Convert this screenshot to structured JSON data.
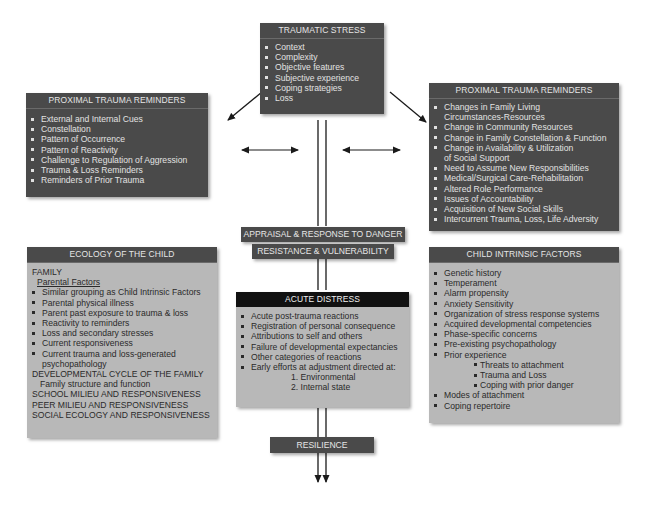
{
  "traumatic_stress": {
    "title": "TRAUMATIC STRESS",
    "items": [
      "Context",
      "Complexity",
      "Objective features",
      "Subjective experience",
      "Coping strategies",
      "Loss"
    ]
  },
  "proximal_left": {
    "title": "PROXIMAL TRAUMA REMINDERS",
    "items": [
      "External and Internal Cues",
      "Constellation",
      "Pattern of Occurrence",
      "Pattern of Reactivity",
      "Challenge to Regulation of Aggression",
      "Trauma & Loss Reminders",
      "Reminders of Prior Trauma"
    ]
  },
  "proximal_right": {
    "title": "PROXIMAL TRAUMA REMINDERS",
    "items": [
      {
        "line1": "Changes in Family Living",
        "line2": "Circumstances-Resources"
      },
      {
        "line1": "Change in Community Resources"
      },
      {
        "line1": "Change in Family Constellation & Function"
      },
      {
        "line1": "Change in Availability & Utilization",
        "line2": "of Social Support"
      },
      {
        "line1": "Need to Assume New Responsibilities"
      },
      {
        "line1": "Medical/Surgical Care-Rehabilitation"
      },
      {
        "line1": "Altered Role Performance"
      },
      {
        "line1": "Issues of Accountability"
      },
      {
        "line1": "Acquisition of New Social Skills"
      },
      {
        "line1": "Intercurrent Trauma, Loss, Life Adversity"
      }
    ]
  },
  "appraisal": {
    "line1": "APPRAISAL & RESPONSE TO DANGER",
    "line2": "RESISTANCE & VULNERABILITY"
  },
  "ecology": {
    "title": "ECOLOGY OF THE CHILD",
    "family": "FAMILY",
    "parental_factors": "Parental Factors",
    "items": [
      "Similar grouping as Child Intrinsic Factors",
      "Parental physical illness",
      "Parent past exposure to trauma & loss",
      "Reactivity to reminders",
      "Loss and secondary stresses",
      "Current responsiveness"
    ],
    "last_item_line1": "Current trauma and loss-generated",
    "last_item_line2": "psychopathology",
    "developmental": "DEVELOPMENTAL CYCLE OF THE FAMILY",
    "family_structure": "Family structure and function",
    "school": "SCHOOL MILIEU AND RESPONSIVENESS",
    "peer": "PEER MILIEU AND RESPONSIVENESS",
    "social": "SOCIAL ECOLOGY AND RESPONSIVENESS"
  },
  "acute_distress": {
    "title": "ACUTE DISTRESS",
    "items": [
      "Acute post-trauma reactions",
      "Registration of personal consequence",
      "Attributions to self and others",
      "Failure of developmental expectancies",
      "Other categories of reactions",
      "Early efforts at adjustment directed at:"
    ],
    "numbered": [
      "1.  Environmental",
      "2.  Internal state"
    ]
  },
  "child_intrinsic": {
    "title": "CHILD INTRINSIC FACTORS",
    "items": [
      "Genetic history",
      "Temperament",
      "Alarm propensity",
      "Anxiety Sensitivity",
      "Organization of stress response systems",
      "Acquired developmental competencies",
      "Phase-specific concerns",
      "Pre-existing psychopathology",
      "Prior experience"
    ],
    "prior_sub": [
      "Threats to attachment",
      "Trauma and Loss",
      "Coping with prior danger"
    ],
    "after": [
      "Modes of attachment",
      "Coping repertoire"
    ]
  },
  "resilience": {
    "label": "RESILIENCE"
  },
  "colors": {
    "dark_box": "#4a4a4a",
    "light_box": "#b8b8b8",
    "acute_header": "#111111",
    "line": "#1a1a1a"
  }
}
